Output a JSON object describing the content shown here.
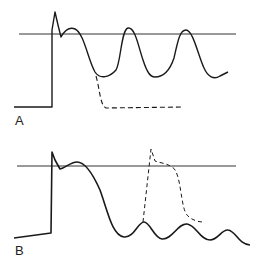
{
  "figure": {
    "panels": [
      {
        "label": "A",
        "threshold_line": {
          "x1": 19,
          "x2": 236,
          "y": 34
        },
        "solid_trace": "M14,107 L52,107 L52,30 L55,12 L58,25 L61,37 C65,30 70,27 75,29 C84,33 88,60 95,72 C100,80 110,77 116,70 C121,62 121,30 128,28 C135,27 138,45 143,60 C147,72 150,77 155,77 C163,77 170,70 174,58 C178,40 180,30 186,30 C193,30 198,55 204,68 C208,77 214,80 220,76 L228,72",
        "dashed_trace": "M96,76 C100,90 100,105 106,108 L183,107"
      },
      {
        "label": "B",
        "threshold_line": {
          "x1": 17,
          "x2": 236,
          "y": 166
        },
        "solid_trace": "M14,238 L51,233 L52,152 L55,160 L60,169 C66,168 70,162 77,162 C85,162 92,172 100,190 C108,212 112,235 124,237 C134,238 138,222 144,222 C150,222 154,238 162,239 C172,240 178,223 187,224 C196,225 200,240 210,240 C218,240 222,229 228,230 C236,231 238,244 250,245",
        "dashed_trace": "M143,222 L151,149 L155,161 C160,163 166,163 172,167 C182,172 180,210 188,216 C192,220 198,222 203,222"
      }
    ],
    "colors": {
      "line": "#1a1a1a",
      "threshold": "#333333",
      "background": "#ffffff"
    }
  }
}
